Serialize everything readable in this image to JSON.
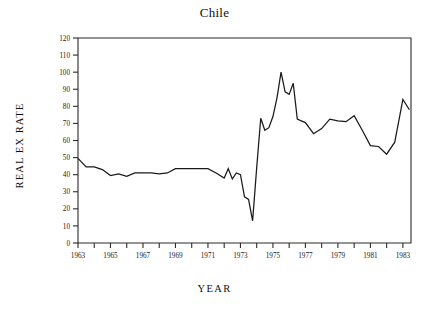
{
  "chart_data": {
    "type": "line",
    "title": "Chile",
    "xlabel": "YEAR",
    "ylabel": "REAL EX RATE",
    "xlim": [
      1963,
      1983.5
    ],
    "ylim": [
      0,
      120
    ],
    "grid": false,
    "legend": null,
    "y_ticks": [
      0,
      10,
      20,
      30,
      40,
      50,
      60,
      70,
      80,
      90,
      100,
      110,
      120
    ],
    "y_tick_labels": [
      "0",
      "10",
      "20",
      "30",
      "40",
      "50",
      "60",
      "70",
      "80",
      "90",
      "100",
      "110",
      "120"
    ],
    "x_ticks": [
      1963,
      1964,
      1965,
      1966,
      1967,
      1968,
      1969,
      1970,
      1971,
      1972,
      1973,
      1974,
      1975,
      1976,
      1977,
      1978,
      1979,
      1980,
      1981,
      1982,
      1983
    ],
    "x_tick_labels": [
      "1963",
      "",
      "1965",
      "",
      "1967",
      "",
      "1969",
      "",
      "1971",
      "",
      "1973",
      "",
      "1975",
      "",
      "1977",
      "",
      "1979",
      "",
      "1981",
      "",
      "1983"
    ],
    "line_color": "#1a1a1a",
    "axis_color": "#2b2b2b",
    "series": [
      {
        "name": "REAL EX RATE",
        "x": [
          1963.0,
          1963.5,
          1964.0,
          1964.5,
          1965.0,
          1965.5,
          1966.0,
          1966.5,
          1967.0,
          1967.5,
          1968.0,
          1968.5,
          1969.0,
          1969.5,
          1970.0,
          1970.5,
          1971.0,
          1971.5,
          1972.0,
          1972.25,
          1972.5,
          1972.75,
          1973.0,
          1973.25,
          1973.5,
          1973.75,
          1974.0,
          1974.25,
          1974.5,
          1974.75,
          1975.0,
          1975.25,
          1975.5,
          1975.75,
          1976.0,
          1976.25,
          1976.5,
          1976.75,
          1977.0,
          1977.5,
          1978.0,
          1978.5,
          1979.0,
          1979.5,
          1980.0,
          1980.5,
          1981.0,
          1981.5,
          1982.0,
          1982.5,
          1983.0,
          1983.4
        ],
        "y": [
          49.5,
          44.5,
          44.5,
          43.0,
          39.5,
          40.5,
          39.0,
          41.0,
          41.0,
          41.0,
          40.5,
          41.0,
          43.5,
          43.5,
          43.5,
          43.5,
          43.5,
          41.0,
          38.0,
          43.5,
          37.5,
          41.0,
          40.0,
          27.0,
          25.5,
          13.0,
          44.0,
          73.0,
          66.0,
          67.5,
          74.0,
          85.0,
          100.0,
          88.5,
          87.0,
          93.5,
          72.5,
          71.5,
          70.5,
          64.0,
          67.0,
          72.5,
          71.5,
          71.0,
          74.5,
          66.0,
          57.0,
          56.5,
          52.0,
          59.0,
          84.0,
          78.0
        ]
      }
    ]
  },
  "axes": {
    "title_text": "Chile",
    "x_axis_title": "YEAR",
    "y_axis_title": "REAL EX RATE"
  }
}
